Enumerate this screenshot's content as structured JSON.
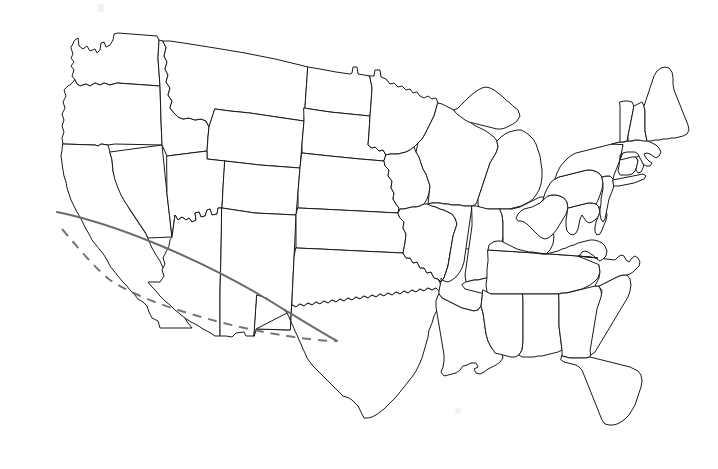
{
  "figure": {
    "kind": "map",
    "title": "Blank outline map of the contiguous United States",
    "width": 718,
    "height": 469,
    "background_color": "#ffffff",
    "border_color": "#1a1a1a",
    "border_width": 1,
    "labels_visible": false,
    "legend_visible": false,
    "axis_visible": false,
    "projection_note": "Albers-like conic, curved northern and southern borders"
  },
  "map": {
    "region": "Contiguous United States",
    "alaska_shown": false,
    "hawaii_shown": false,
    "state_count_drawn": 49,
    "notable_features": [
      "Great Lakes outlines",
      "Michigan Upper and Lower Peninsulas",
      "Puget Sound",
      "Chesapeake Bay",
      "Florida peninsula",
      "Cape Cod",
      "Long Island",
      "Outer Banks",
      "Minnesota Northwest Angle",
      "Mississippi River delta"
    ],
    "states": [
      {
        "name": "Washington",
        "code": "WA"
      },
      {
        "name": "Oregon",
        "code": "OR"
      },
      {
        "name": "California",
        "code": "CA"
      },
      {
        "name": "Nevada",
        "code": "NV"
      },
      {
        "name": "Idaho",
        "code": "ID"
      },
      {
        "name": "Montana",
        "code": "MT"
      },
      {
        "name": "Wyoming",
        "code": "WY"
      },
      {
        "name": "Utah",
        "code": "UT"
      },
      {
        "name": "Arizona",
        "code": "AZ"
      },
      {
        "name": "Colorado",
        "code": "CO"
      },
      {
        "name": "New Mexico",
        "code": "NM"
      },
      {
        "name": "North Dakota",
        "code": "ND"
      },
      {
        "name": "South Dakota",
        "code": "SD"
      },
      {
        "name": "Nebraska",
        "code": "NE"
      },
      {
        "name": "Kansas",
        "code": "KS"
      },
      {
        "name": "Oklahoma",
        "code": "OK"
      },
      {
        "name": "Texas",
        "code": "TX"
      },
      {
        "name": "Minnesota",
        "code": "MN"
      },
      {
        "name": "Iowa",
        "code": "IA"
      },
      {
        "name": "Missouri",
        "code": "MO"
      },
      {
        "name": "Arkansas",
        "code": "AR"
      },
      {
        "name": "Louisiana",
        "code": "LA"
      },
      {
        "name": "Wisconsin",
        "code": "WI"
      },
      {
        "name": "Illinois",
        "code": "IL"
      },
      {
        "name": "Michigan",
        "code": "MI"
      },
      {
        "name": "Indiana",
        "code": "IN"
      },
      {
        "name": "Ohio",
        "code": "OH"
      },
      {
        "name": "Kentucky",
        "code": "KY"
      },
      {
        "name": "Tennessee",
        "code": "TN"
      },
      {
        "name": "Mississippi",
        "code": "MS"
      },
      {
        "name": "Alabama",
        "code": "AL"
      },
      {
        "name": "Georgia",
        "code": "GA"
      },
      {
        "name": "Florida",
        "code": "FL"
      },
      {
        "name": "South Carolina",
        "code": "SC"
      },
      {
        "name": "North Carolina",
        "code": "NC"
      },
      {
        "name": "Virginia",
        "code": "VA"
      },
      {
        "name": "West Virginia",
        "code": "WV"
      },
      {
        "name": "Maryland",
        "code": "MD"
      },
      {
        "name": "Delaware",
        "code": "DE"
      },
      {
        "name": "Pennsylvania",
        "code": "PA"
      },
      {
        "name": "New Jersey",
        "code": "NJ"
      },
      {
        "name": "New York",
        "code": "NY"
      },
      {
        "name": "Connecticut",
        "code": "CT"
      },
      {
        "name": "Rhode Island",
        "code": "RI"
      },
      {
        "name": "Massachusetts",
        "code": "MA"
      },
      {
        "name": "Vermont",
        "code": "VT"
      },
      {
        "name": "New Hampshire",
        "code": "NH"
      },
      {
        "name": "Maine",
        "code": "ME"
      }
    ]
  },
  "overlays": {
    "description": "Two gray reference arcs drawn over the southwestern states",
    "items": [
      {
        "id": "solid-arc",
        "style": "solid",
        "color": "#6b6b6b",
        "width": 2,
        "start_point": [
          57,
          212
        ],
        "end_point": [
          337,
          341
        ],
        "crosses": [
          "California",
          "Nevada",
          "Arizona",
          "New Mexico",
          "Texas"
        ]
      },
      {
        "id": "dashed-arc",
        "style": "dashed",
        "color": "#757575",
        "width": 2,
        "dash_pattern": "9 7",
        "start_point": [
          62,
          229
        ],
        "end_point": [
          337,
          341
        ],
        "crosses": [
          "California",
          "Arizona",
          "New Mexico",
          "Texas"
        ]
      }
    ]
  }
}
